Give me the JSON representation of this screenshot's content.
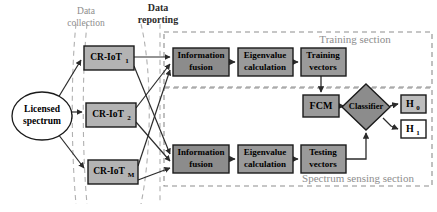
{
  "figure": {
    "type": "block-diagram",
    "title": "",
    "background": "#ffffff"
  },
  "colors": {
    "box_fill_light": "#b3b3b3",
    "box_fill_dark": "#8c8c8c",
    "box_fill_mid": "#9a9a9a",
    "box_stroke": "#1a1a1a",
    "hyp_fill": "#bdbdbd",
    "hyp_fill_white": "#ffffff",
    "dashed_gray": "#9f9f9f",
    "dashed_section": "#8d8d8d",
    "line": "#2b2b2b",
    "ellipse_fill": "#ffffff",
    "text_dark": "#000000",
    "text_gray": "#8d8d8d"
  },
  "flow_labels": [
    {
      "id": "data-collection",
      "line1": "Data",
      "line2": "collection",
      "x": 85,
      "y": 8,
      "color": "#8d8d8d",
      "weight": "normal",
      "size": 9
    },
    {
      "id": "data-reporting",
      "line1": "Data",
      "line2": "reporting",
      "x": 158,
      "y": 5,
      "color": "#2b2b2b",
      "weight": "bold",
      "size": 9
    }
  ],
  "sections": [
    {
      "id": "training-section",
      "label": "Training section",
      "x": 164,
      "y": 32,
      "w": 268,
      "h": 55,
      "label_x": 355,
      "label_y": 39
    },
    {
      "id": "spectrum-sensing-section",
      "label": "Spectrum sensing section",
      "x": 164,
      "y": 88,
      "w": 268,
      "h": 98,
      "label_x": 358,
      "label_y": 178
    }
  ],
  "source": {
    "id": "licensed-spectrum",
    "line1": "Licensed",
    "line2": "spectrum",
    "cx": 42,
    "cy": 116,
    "rx": 30,
    "ry": 24
  },
  "cr_nodes": [
    {
      "id": "cr-iot-1",
      "label": "CR-IoT",
      "sub": "1",
      "x": 84,
      "y": 46,
      "w": 50,
      "h": 24,
      "fill": "#b3b3b3"
    },
    {
      "id": "cr-iot-2",
      "label": "CR-IoT",
      "sub": "2",
      "x": 86,
      "y": 103,
      "w": 50,
      "h": 24,
      "fill": "#b3b3b3"
    },
    {
      "id": "cr-iot-m",
      "label": "CR-IoT",
      "sub": "M",
      "x": 88,
      "y": 160,
      "w": 50,
      "h": 24,
      "fill": "#b3b3b3"
    }
  ],
  "process_boxes": [
    {
      "id": "information-fusion-training",
      "line1": "Information",
      "line2": "fusion",
      "x": 173,
      "y": 48,
      "w": 56,
      "h": 28,
      "fill": "#8c8c8c"
    },
    {
      "id": "eigenvalue-calculation-training",
      "line1": "Eigenvalue",
      "line2": "calculation",
      "x": 238,
      "y": 48,
      "w": 55,
      "h": 28,
      "fill": "#9a9a9a"
    },
    {
      "id": "training-vectors",
      "line1": "Training",
      "line2": "vectors",
      "x": 301,
      "y": 48,
      "w": 45,
      "h": 28,
      "fill": "#9a9a9a"
    },
    {
      "id": "information-fusion-sensing",
      "line1": "Information",
      "line2": "fusion",
      "x": 173,
      "y": 145,
      "w": 56,
      "h": 28,
      "fill": "#8c8c8c"
    },
    {
      "id": "eigenvalue-calculation-sensing",
      "line1": "Eigenvalue",
      "line2": "calculation",
      "x": 238,
      "y": 145,
      "w": 55,
      "h": 28,
      "fill": "#9a9a9a"
    },
    {
      "id": "testing-vectors",
      "line1": "Testing",
      "line2": "vectors",
      "x": 301,
      "y": 145,
      "w": 45,
      "h": 28,
      "fill": "#9a9a9a"
    }
  ],
  "fcm": {
    "id": "fcm-box",
    "label": "FCM",
    "x": 303,
    "y": 95,
    "w": 36,
    "h": 22,
    "fill": "#9a9a9a"
  },
  "classifier": {
    "id": "classifier-diamond",
    "label": "Classifier",
    "cx": 366,
    "cy": 107,
    "rx": 24,
    "ry": 23,
    "fill": "#8c8c8c"
  },
  "hypotheses": [
    {
      "id": "hypothesis-h0",
      "label": "H",
      "sub": "0",
      "x": 401,
      "y": 95,
      "w": 25,
      "h": 18,
      "fill": "#bdbdbd"
    },
    {
      "id": "hypothesis-h1",
      "label": "H",
      "sub": "1",
      "x": 401,
      "y": 120,
      "w": 25,
      "h": 18,
      "fill": "#ffffff"
    }
  ],
  "brace_regions": [
    {
      "id": "data-collection-brace",
      "x": 74,
      "y": 22,
      "w": 14,
      "h": 183
    },
    {
      "id": "data-reporting-brace",
      "x": 140,
      "y": 22,
      "w": 20,
      "h": 183
    }
  ]
}
